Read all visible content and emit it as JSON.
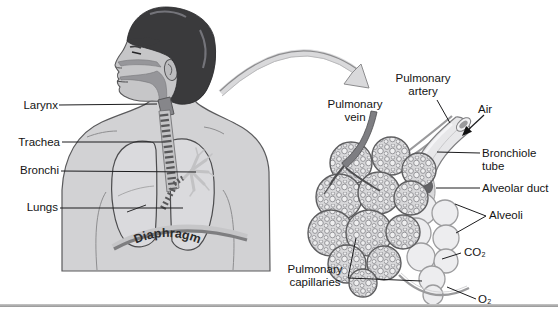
{
  "labels": {
    "larynx": "Larynx",
    "trachea": "Trachea",
    "bronchi": "Bronchi",
    "lungs": "Lungs",
    "diaphragm": "Diaphragm",
    "pulmonary_vein": "Pulmonary vein",
    "pulmonary_artery": "Pulmonary artery",
    "air": "Air",
    "bronchiole_tube": "Bronchiole tube",
    "alveolar_duct": "Alveolar duct",
    "alveoli": "Alveoli",
    "co2": "CO₂",
    "o2": "O₂",
    "pulmonary_capillaries": "Pulmonary capillaries"
  },
  "colors": {
    "skin": "#c6c6c8",
    "torso": "#d2d2d4",
    "hair": "#3a3a3c",
    "airway_highlight": "#96969a",
    "illustration_gray": "#dcdcde",
    "vessel_gray": "#7e7e82",
    "leader_line": "#1c1c1e",
    "bottom_rule": "#a0a0a0"
  }
}
